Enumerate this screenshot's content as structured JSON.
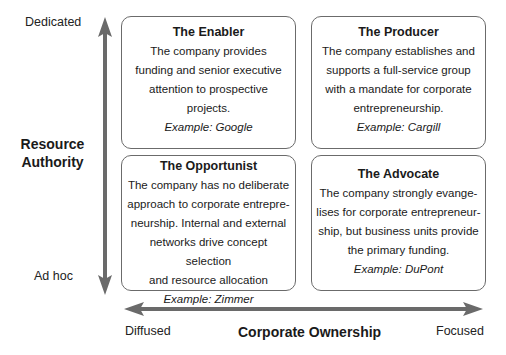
{
  "y_axis": {
    "title_line1": "Resource",
    "title_line2": "Authority",
    "top_label": "Dedicated",
    "bottom_label": "Ad hoc",
    "arrow_color": "#6a6a6a"
  },
  "x_axis": {
    "title": "Corporate Ownership",
    "left_label": "Diffused",
    "right_label": "Focused",
    "arrow_color": "#6a6a6a"
  },
  "quadrants": {
    "top_left": {
      "title": "The Enabler",
      "lines": [
        "The company provides",
        "funding and senior executive",
        "attention to prospective",
        "projects."
      ],
      "example": "Example: Google"
    },
    "top_right": {
      "title": "The Producer",
      "lines": [
        "The company establishes and",
        "supports a full-service group",
        "with a mandate for corporate",
        "entrepreneurship."
      ],
      "example": "Example: Cargill"
    },
    "bottom_left": {
      "title": "The Opportunist",
      "lines": [
        "The company has no deliberate",
        "approach to corporate entrepre-",
        "neurship. Internal and external",
        "networks drive concept selection",
        "and resource allocation"
      ],
      "example": "Example: Zimmer"
    },
    "bottom_right": {
      "title": "The Advocate",
      "lines": [
        "The company strongly evange-",
        "lises for corporate entrepreneur-",
        "ship, but business units provide",
        "the primary funding."
      ],
      "example": "Example: DuPont"
    }
  }
}
